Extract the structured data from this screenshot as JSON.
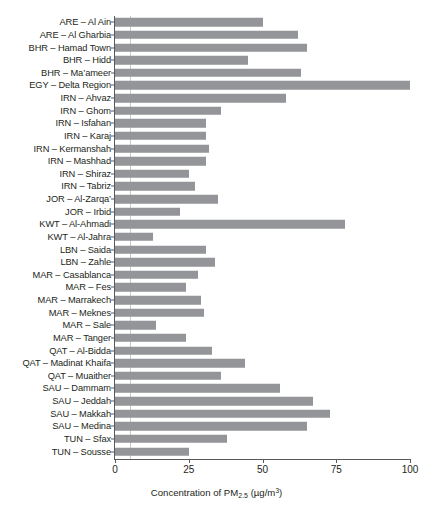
{
  "chart_data": {
    "type": "bar",
    "orientation": "horizontal",
    "title": "",
    "xlabel": "Concentration of PM2.5 (µg/m³)",
    "ylabel": "",
    "xlim": [
      0,
      100
    ],
    "xticks": [
      0,
      25,
      50,
      75,
      100
    ],
    "xtick_labels": [
      "0",
      "25",
      "50",
      "75",
      "100"
    ],
    "grid": true,
    "gridlines_x": [
      5
    ],
    "legend": "none",
    "bar_color": "#939598",
    "axis_color": "#58595b",
    "categories": [
      "ARE – Al Ain",
      "ARE – Al Gharbia",
      "BHR – Hamad Town",
      "BHR – Hidd",
      "BHR – Ma’ameer",
      "EGY – Delta Region",
      "IRN – Ahvaz",
      "IRN – Ghom",
      "IRN – Isfahan",
      "IRN – Karaj",
      "IRN – Kermanshah",
      "IRN – Mashhad",
      "IRN – Shiraz",
      "IRN – Tabriz",
      "JOR – Al-Zarqa’",
      "JOR – Irbid",
      "KWT – Al-Ahmadi",
      "KWT – Al-Jahra",
      "LBN – Saida",
      "LBN – Zahle",
      "MAR – Casablanca",
      "MAR – Fes",
      "MAR – Marrakech",
      "MAR – Meknes",
      "MAR – Sale",
      "MAR – Tanger",
      "QAT – Al-Bidda",
      "QAT – Madinat Khaifa",
      "QAT – Muaither",
      "SAU – Dammam",
      "SAU – Jeddah",
      "SAU – Makkah",
      "SAU – Medina",
      "TUN – Sfax",
      "TUN – Sousse"
    ],
    "values": [
      50,
      62,
      65,
      45,
      63,
      100,
      58,
      36,
      31,
      31,
      32,
      31,
      25,
      27,
      35,
      22,
      78,
      13,
      31,
      34,
      28,
      24,
      29,
      30,
      14,
      24,
      33,
      44,
      36,
      56,
      67,
      73,
      65,
      38,
      25
    ],
    "units": "µg/m³"
  }
}
